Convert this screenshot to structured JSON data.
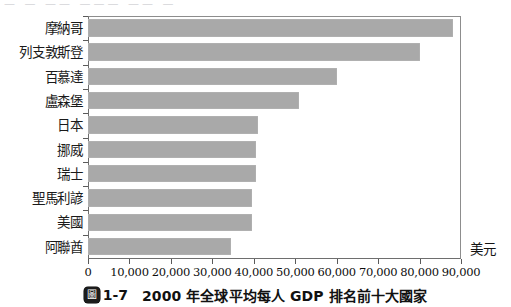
{
  "top_sliver": {
    "text": "— —  —— ———  —— —"
  },
  "caption": {
    "badge_glyph": "圖",
    "number": "1-7",
    "text": "2000 年全球平均每人 GDP 排名前十大國家"
  },
  "axis": {
    "unit_label": "美元"
  },
  "chart_data": {
    "type": "bar",
    "orientation": "horizontal",
    "title": "2000 年全球平均每人 GDP 排名前十大國家",
    "xlabel": "美元",
    "ylabel": "",
    "xlim": [
      0,
      90000
    ],
    "xticks": [
      0,
      10000,
      20000,
      30000,
      40000,
      50000,
      60000,
      70000,
      80000,
      90000
    ],
    "xtick_labels": [
      "0",
      "10,000",
      "20,000",
      "30,000",
      "40,000",
      "50,000",
      "60,000",
      "70,000",
      "80,000",
      "90,000"
    ],
    "grid": false,
    "legend": null,
    "bar_color": "#a9a9a9",
    "frame_color": "#6e6e6e",
    "categories": [
      "摩納哥",
      "列支敦斯登",
      "百慕達",
      "盧森堡",
      "日本",
      "挪威",
      "瑞士",
      "聖馬利諺",
      "美國",
      "阿聯酋"
    ],
    "values": [
      88000,
      80000,
      60000,
      51000,
      41000,
      40500,
      40500,
      39500,
      39500,
      34500
    ]
  }
}
